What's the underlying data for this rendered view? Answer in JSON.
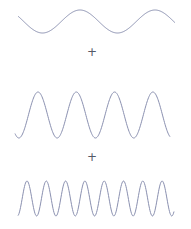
{
  "diagram": {
    "wave_color": "#8a90b0",
    "operator_color": "#555a66",
    "waves": [
      {
        "name": "low-frequency-wave",
        "x_start": 18,
        "x_end": 175,
        "center_y": 21.5,
        "amplitude": 11.5,
        "period": 75,
        "phase_peak_x": 80,
        "peaks_visible": 2
      },
      {
        "name": "mid-frequency-wave",
        "x_start": 15,
        "x_end": 170,
        "center_y": 115,
        "amplitude": 23,
        "period": 38.3,
        "phase_peak_x": 38,
        "peaks_visible": 4
      },
      {
        "name": "high-frequency-wave",
        "x_start": 18,
        "x_end": 174,
        "center_y": 198.5,
        "amplitude": 17.5,
        "period": 19.3,
        "phase_peak_x": 27,
        "peaks_visible": 8
      }
    ],
    "operators": [
      {
        "symbol": "+",
        "x": 92,
        "y": 52
      },
      {
        "symbol": "+",
        "x": 92,
        "y": 157
      }
    ]
  }
}
